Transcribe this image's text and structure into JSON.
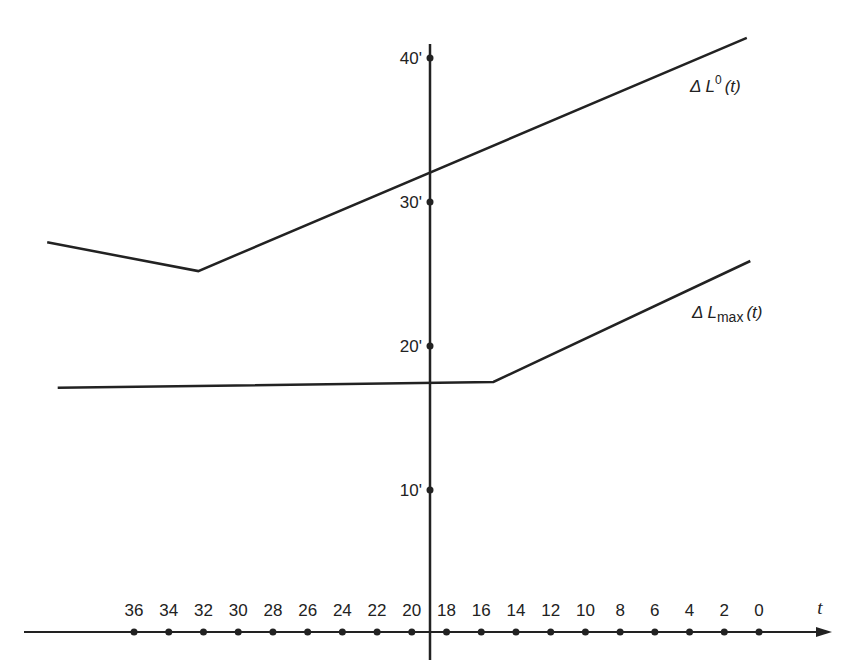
{
  "chart_data": {
    "type": "line",
    "title": "",
    "xlabel": "t",
    "ylabel": "",
    "x_direction": "decreasing to the right",
    "x_ticks": [
      36,
      34,
      32,
      30,
      28,
      26,
      24,
      22,
      20,
      18,
      16,
      14,
      12,
      10,
      8,
      6,
      4,
      2,
      0
    ],
    "y_ticks": [
      "10'",
      "20'",
      "30'",
      "40'"
    ],
    "y_tick_values": [
      10,
      20,
      30,
      40
    ],
    "xlim": [
      42,
      -3
    ],
    "ylim": [
      0,
      42
    ],
    "grid": false,
    "legend": "inline labels at right end of each line",
    "series": [
      {
        "name": "ΔL⁰(t)",
        "label_main": "Δ L",
        "label_sup": "0",
        "label_tail": "(t)",
        "points": [
          {
            "t": 41,
            "value": 27.2
          },
          {
            "t": 32.3,
            "value": 25.2
          },
          {
            "t": 0.7,
            "value": 41.4
          }
        ]
      },
      {
        "name": "ΔLmax(t)",
        "label_main": "Δ L",
        "label_sub": "max",
        "label_tail": "(t)",
        "points": [
          {
            "t": 40.4,
            "value": 17.1
          },
          {
            "t": 15.3,
            "value": 17.5
          },
          {
            "t": 0.5,
            "value": 25.9
          }
        ]
      }
    ]
  },
  "colors": {
    "ink": "#222222",
    "background": "#ffffff"
  }
}
